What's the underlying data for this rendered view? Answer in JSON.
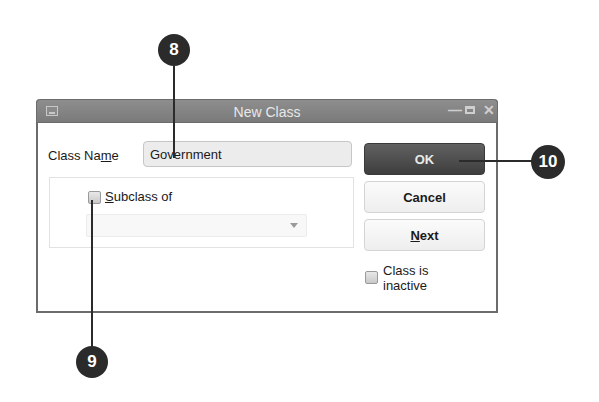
{
  "dialog": {
    "title": "New Class",
    "window_controls": [
      "minimize-icon",
      "maximize-icon",
      "close-icon"
    ],
    "class_name": {
      "label_pre": "Class Na",
      "label_accel": "m",
      "label_post": "e",
      "value": "Government"
    },
    "subclass": {
      "checked": false,
      "label_accel": "S",
      "label_rest": "ubclass of",
      "dropdown_value": "",
      "dropdown_enabled": false
    },
    "buttons": {
      "ok": "OK",
      "cancel": "Cancel",
      "next_accel": "N",
      "next_rest": "ext"
    },
    "inactive": {
      "checked": false,
      "label": "Class is inactive"
    }
  },
  "callouts": [
    {
      "number": "8",
      "target": "class-name-input"
    },
    {
      "number": "9",
      "target": "subclass-checkbox"
    },
    {
      "number": "10",
      "target": "ok-button"
    }
  ],
  "colors": {
    "titlebar": "#808080",
    "ok_button": "#4a4a4a",
    "callout": "#2b2b2b"
  }
}
